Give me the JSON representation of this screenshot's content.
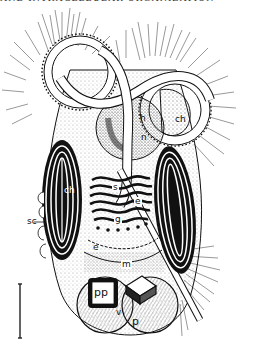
{
  "figure": {
    "header_text_cut": "AND INTRACELLULAR ORGANIZATION",
    "labels": {
      "ch_top_right": "ch",
      "h": "h",
      "n": "n",
      "s": "s",
      "e_upper": "e",
      "g": "g",
      "ch_left": "ch",
      "sc": "sc",
      "e_lower": "e",
      "m": "m",
      "pp": "pp",
      "v": "v",
      "p": "p"
    },
    "scale_bar": {
      "orientation": "vertical",
      "label": ""
    },
    "colors": {
      "ink": "#111111",
      "paper": "#ffffff",
      "stipple": "#888888"
    }
  }
}
